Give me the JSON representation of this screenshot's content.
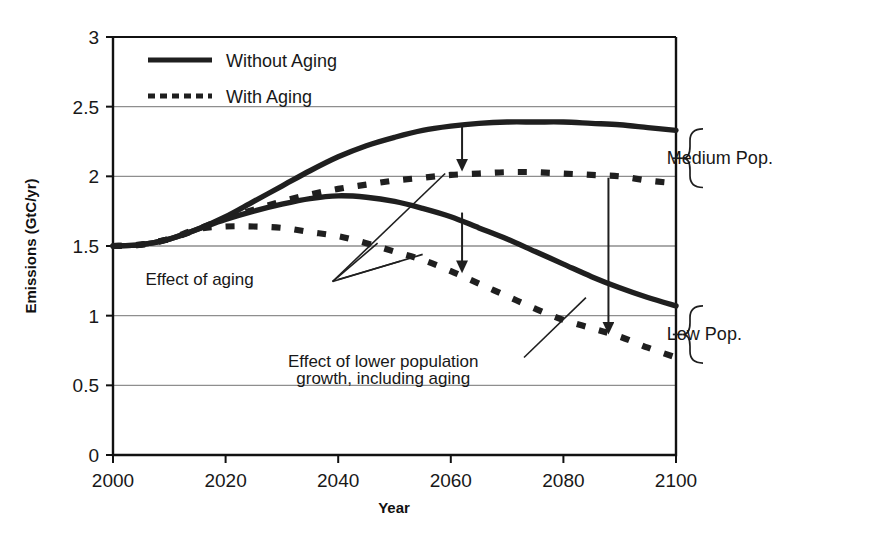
{
  "chart_data": {
    "type": "line",
    "title": "",
    "xlabel": "Year",
    "ylabel": "Emissions (GtC/yr)",
    "xlim": [
      2000,
      2100
    ],
    "ylim": [
      0,
      3
    ],
    "xticks": [
      "2000",
      "2020",
      "2040",
      "2060",
      "2080",
      "2100"
    ],
    "yticks": [
      "0",
      "0.5",
      "1",
      "1.5",
      "2",
      "2.5",
      "3"
    ],
    "grid": "horizontal",
    "legend_position": "top-left",
    "legend": [
      {
        "label": "Without Aging",
        "style": "solid"
      },
      {
        "label": "With Aging",
        "style": "dotted"
      }
    ],
    "x": [
      2000,
      2005,
      2010,
      2015,
      2020,
      2025,
      2030,
      2035,
      2040,
      2045,
      2050,
      2055,
      2060,
      2065,
      2070,
      2075,
      2080,
      2085,
      2090,
      2095,
      2100
    ],
    "series": [
      {
        "name": "Medium Pop. - Without Aging",
        "group": "Medium Pop.",
        "style": "solid",
        "values": [
          1.5,
          1.51,
          1.55,
          1.62,
          1.71,
          1.82,
          1.93,
          2.04,
          2.14,
          2.22,
          2.28,
          2.33,
          2.36,
          2.38,
          2.39,
          2.39,
          2.39,
          2.38,
          2.37,
          2.35,
          2.33
        ]
      },
      {
        "name": "Medium Pop. - With Aging",
        "group": "Medium Pop.",
        "style": "dotted",
        "values": [
          1.5,
          1.51,
          1.55,
          1.62,
          1.7,
          1.76,
          1.82,
          1.87,
          1.91,
          1.94,
          1.97,
          1.99,
          2.01,
          2.02,
          2.03,
          2.03,
          2.02,
          2.01,
          2.0,
          1.97,
          1.95
        ]
      },
      {
        "name": "Low Pop. - Without Aging",
        "group": "Low Pop.",
        "style": "solid",
        "values": [
          1.5,
          1.51,
          1.55,
          1.62,
          1.69,
          1.75,
          1.8,
          1.84,
          1.86,
          1.85,
          1.82,
          1.77,
          1.71,
          1.63,
          1.55,
          1.46,
          1.37,
          1.28,
          1.2,
          1.13,
          1.07
        ]
      },
      {
        "name": "Low Pop. - With Aging",
        "group": "Low Pop.",
        "style": "dotted",
        "values": [
          1.5,
          1.51,
          1.55,
          1.62,
          1.64,
          1.64,
          1.63,
          1.6,
          1.57,
          1.52,
          1.46,
          1.4,
          1.32,
          1.23,
          1.14,
          1.05,
          0.97,
          0.91,
          0.85,
          0.77,
          0.7
        ]
      }
    ],
    "annotations": [
      {
        "text": "Effect of aging",
        "x": 2025,
        "y": 1.22
      },
      {
        "text": "Effect of lower population",
        "x": 2048,
        "y": 0.63
      },
      {
        "text": "growth, including aging",
        "x": 2048,
        "y": 0.51
      }
    ],
    "arrows": [
      {
        "name": "aging-medium",
        "year": 2062,
        "from": 2.38,
        "to": 2.03
      },
      {
        "name": "aging-low",
        "year": 2062,
        "from": 1.74,
        "to": 1.3
      },
      {
        "name": "lower-population",
        "year": 2088,
        "from": 1.99,
        "to": 0.86
      }
    ],
    "braces": [
      {
        "label": "Medium Pop.",
        "from": 2.34,
        "to": 1.92
      },
      {
        "label": "Low Pop.",
        "from": 1.07,
        "to": 0.66
      }
    ]
  },
  "colors": {
    "curve": "#1f1f1f",
    "grid": "#8e8e8e",
    "axis": "#111111",
    "text": "#181818",
    "background": "#ffffff"
  }
}
